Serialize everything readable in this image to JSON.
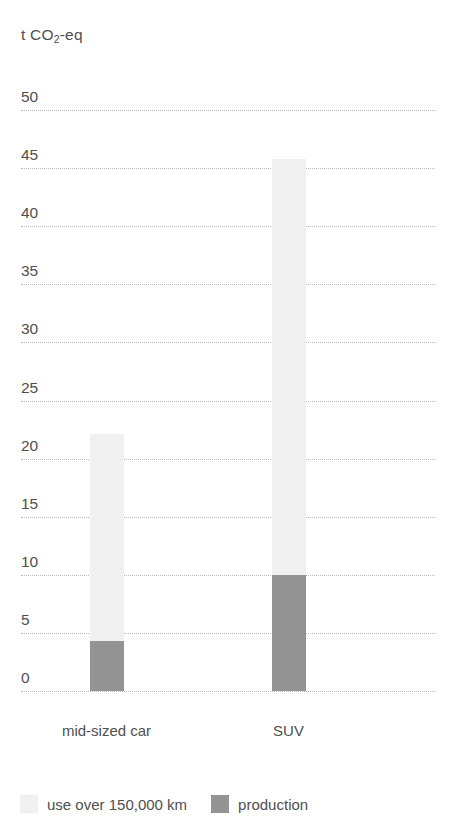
{
  "chart_data": {
    "type": "bar",
    "subtype": "stacked-bar",
    "title": "",
    "subtitle": "",
    "unit_label": "t CO2-eq",
    "unit_label_prefix": "t CO",
    "unit_label_sub": "2",
    "unit_label_suffix": "-eq",
    "xlabel": "",
    "ylabel": "t CO2-eq",
    "categories": [
      "mid-sized car",
      "SUV"
    ],
    "series": [
      {
        "name": "use over 150,000 km",
        "color": "#f0f0f0",
        "values": [
          17.8,
          35.8
        ]
      },
      {
        "name": "production",
        "color": "#939393",
        "values": [
          4.3,
          10.0
        ]
      }
    ],
    "totals": [
      22.1,
      45.8
    ],
    "ylim": [
      0,
      50
    ],
    "ytick_values": [
      0,
      5,
      10,
      15,
      20,
      25,
      30,
      35,
      40,
      45,
      50
    ],
    "ytick_labels": [
      "0",
      "5",
      "10",
      "15",
      "20",
      "25",
      "30",
      "35",
      "40",
      "45",
      "50"
    ],
    "grid": true,
    "grid_style": "dotted",
    "grid_color": "#b9b9b9",
    "legend_position": "bottom-left",
    "background": "#ffffff",
    "text_color": "#4f4f4f"
  },
  "legend": {
    "items": [
      {
        "label": "use over 150,000 km",
        "swatch": "legend-swatch-use"
      },
      {
        "label": "production",
        "swatch": "legend-swatch-production"
      }
    ]
  }
}
